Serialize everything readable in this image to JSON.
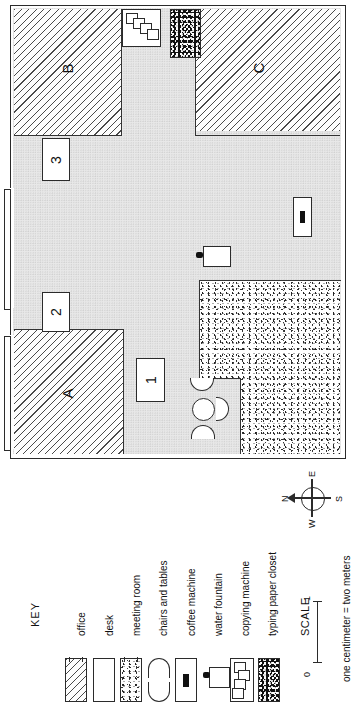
{
  "figure": {
    "type": "floor-plan",
    "orientation": "rotated-90-counterclockwise"
  },
  "plan": {
    "rooms": [
      {
        "id": "A",
        "label": "A",
        "fill": "office-hatch"
      },
      {
        "id": "B",
        "label": "B",
        "fill": "office-hatch"
      },
      {
        "id": "C",
        "label": "C",
        "fill": "office-hatch"
      }
    ],
    "desks": [
      {
        "id": "desk-1",
        "label": "1"
      },
      {
        "id": "desk-2",
        "label": "2"
      },
      {
        "id": "desk-3",
        "label": "3"
      }
    ],
    "furniture": [
      {
        "name": "meeting-room",
        "fill": "speckle"
      },
      {
        "name": "chairs-and-tables",
        "count": 4
      },
      {
        "name": "coffee-machine"
      },
      {
        "name": "water-fountain"
      },
      {
        "name": "copying-machine"
      },
      {
        "name": "typing-paper-closet",
        "fill": "dark-speckle"
      }
    ],
    "doors": 2
  },
  "compass": {
    "north": "N",
    "east": "E",
    "south": "S",
    "west": "W"
  },
  "key": {
    "title": "KEY",
    "items": [
      {
        "label": "office",
        "symbol": "hatched-rect-icon"
      },
      {
        "label": "desk",
        "symbol": "plain-rect-icon"
      },
      {
        "label": "meeting room",
        "symbol": "speckled-rect-icon"
      },
      {
        "label": "chairs and tables",
        "symbol": "semicircles-icon"
      },
      {
        "label": "coffee machine",
        "symbol": "coffee-machine-icon"
      },
      {
        "label": "water fountain",
        "symbol": "water-fountain-icon"
      },
      {
        "label": "copying machine",
        "symbol": "copying-machine-icon"
      },
      {
        "label": "typing paper closet",
        "symbol": "dark-speckled-rect-icon"
      }
    ]
  },
  "scale": {
    "title": "SCALE",
    "min": "0",
    "max": "1",
    "caption": "one centimeter = two meters"
  },
  "colors": {
    "ink": "#2a2a2a",
    "paper": "#ffffff",
    "corridor": "#e8e8e8"
  }
}
